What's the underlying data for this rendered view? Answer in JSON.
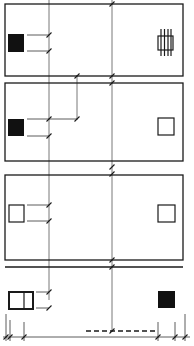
{
  "diagram": {
    "type": "architectural-elevation-dimensions",
    "stroke_color": "#1a1a1a",
    "fill_color": "#111111",
    "guide_color": "#555555",
    "background": "#ffffff",
    "panels": [
      {
        "id": "panel-1",
        "left_icon": "filled-square",
        "right_icon": "barred-square"
      },
      {
        "id": "panel-2",
        "left_icon": "filled-square",
        "right_icon": "hollow-square"
      },
      {
        "id": "panel-3",
        "left_icon": "hollow-square",
        "right_icon": "hollow-square"
      },
      {
        "id": "panel-4",
        "left_icon": "double-window",
        "right_icon": "filled-square"
      }
    ],
    "dimension_lines": {
      "vertical_guides": 3,
      "bottom_baseline": true,
      "dashed_segment": true
    }
  }
}
